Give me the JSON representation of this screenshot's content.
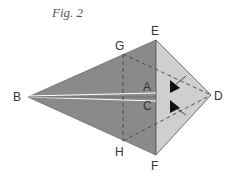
{
  "figure": {
    "title": "Fig. 2",
    "points": {
      "B": "B",
      "E": "E",
      "F": "F",
      "D": "D",
      "G": "G",
      "H": "H",
      "A": "A",
      "C": "C"
    },
    "colors": {
      "dark_panel": "#8a8a8a",
      "light_panel": "#cfcfcf",
      "edge": "#555555",
      "dashed": "#444444",
      "center_line": "#ffffff"
    }
  }
}
